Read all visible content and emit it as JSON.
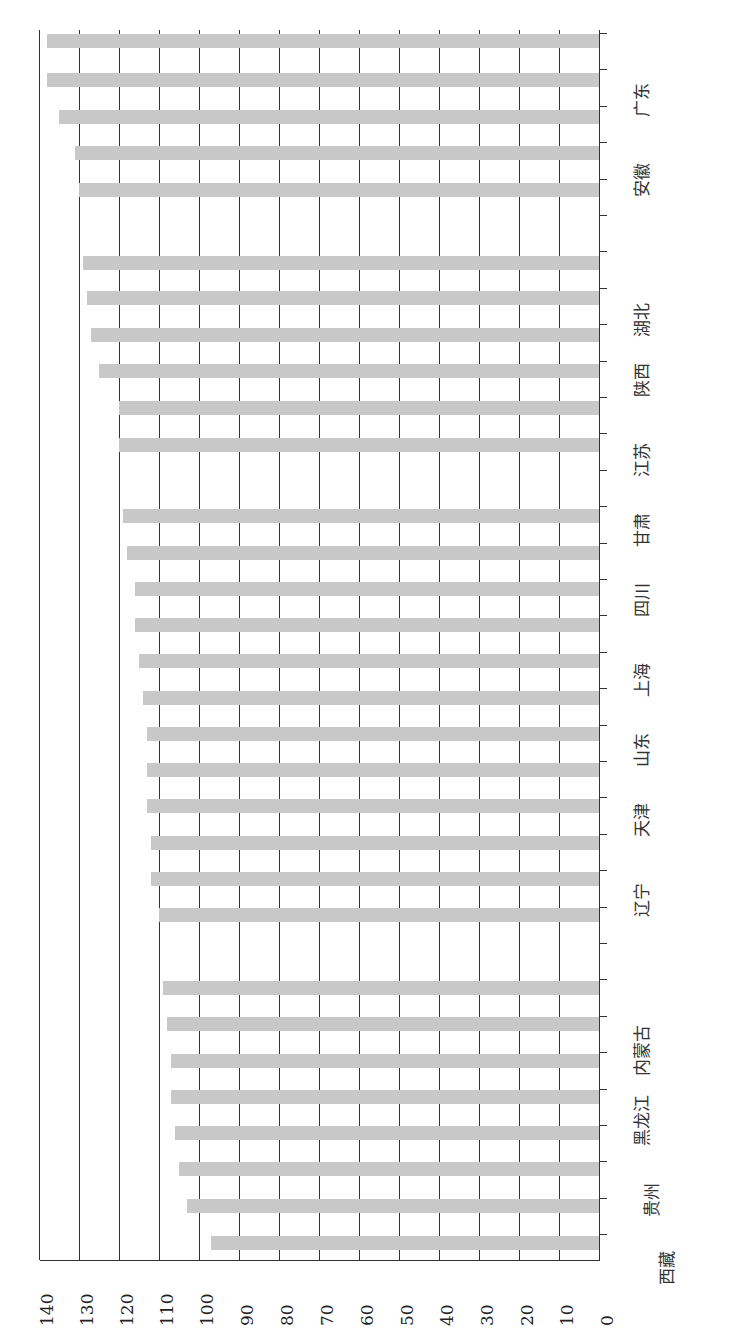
{
  "chart_data": {
    "type": "bar",
    "orientation": "horizontal (page rotated 90°, value axis runs right-to-left)",
    "title": "",
    "xlabel": "",
    "ylabel": "",
    "xlim": [
      0,
      140
    ],
    "grid": true,
    "x_ticks": [
      "0",
      "10",
      "20",
      "30",
      "40",
      "50",
      "60",
      "70",
      "80",
      "90",
      "100",
      "110",
      "120",
      "130",
      "140"
    ],
    "category_labels_visible": [
      "西藏",
      "贵州",
      "黑龙江",
      "内蒙古",
      "辽宁",
      "天津",
      "山东",
      "上海",
      "四川",
      "甘肃",
      "江苏",
      "陕西",
      "湖北",
      "安徽",
      "广东"
    ],
    "bar_count": 31,
    "values": [
      97,
      103,
      105,
      106,
      107,
      107,
      108,
      109,
      110,
      112,
      112,
      113,
      113,
      113,
      114,
      115,
      116,
      116,
      118,
      119,
      120,
      120,
      125,
      127,
      128,
      129,
      130,
      131,
      135,
      138,
      138
    ],
    "values_order": "bottom-to-top (lowest bar first)"
  },
  "colors": {
    "bar": "#c8c8c8",
    "grid": "#333333",
    "background": "#ffffff"
  },
  "layout": {
    "bar_y": [
      1243,
      1206,
      1169,
      1133,
      1097,
      1061,
      1024,
      988,
      915,
      879,
      843,
      806,
      770,
      734,
      698,
      661,
      625,
      589,
      553,
      516,
      445,
      408,
      371,
      335,
      298,
      263,
      190,
      153,
      117,
      80,
      41
    ],
    "label_pos": [
      {
        "x": 665,
        "y": 1268
      },
      {
        "x": 650,
        "y": 1200
      },
      {
        "x": 640,
        "y": 1120
      },
      {
        "x": 640,
        "y": 1050
      },
      {
        "x": 640,
        "y": 900
      },
      {
        "x": 640,
        "y": 820
      },
      {
        "x": 640,
        "y": 750
      },
      {
        "x": 640,
        "y": 680
      },
      {
        "x": 640,
        "y": 600
      },
      {
        "x": 640,
        "y": 530
      },
      {
        "x": 640,
        "y": 460
      },
      {
        "x": 640,
        "y": 380
      },
      {
        "x": 640,
        "y": 320
      },
      {
        "x": 640,
        "y": 180
      },
      {
        "x": 640,
        "y": 100
      }
    ]
  }
}
